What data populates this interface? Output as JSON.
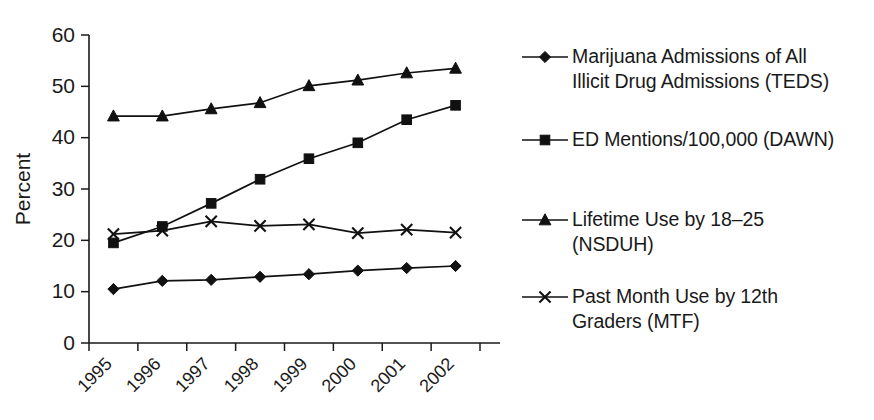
{
  "chart_data": {
    "type": "line",
    "title": "",
    "xlabel": "",
    "ylabel": "Percent",
    "categories": [
      "1995",
      "1996",
      "1997",
      "1998",
      "1999",
      "2000",
      "2001",
      "2002"
    ],
    "ylim": [
      0,
      60
    ],
    "yticks": [
      0,
      10,
      20,
      30,
      40,
      50,
      60
    ],
    "grid": false,
    "legend_position": "right",
    "series": [
      {
        "name": "Marijuana Admissions of All Illicit Drug Admissions (TEDS)",
        "marker": "diamond",
        "values": [
          10.5,
          12.1,
          12.3,
          12.9,
          13.4,
          14.1,
          14.6,
          15.0
        ]
      },
      {
        "name": "ED Mentions/100,000 (DAWN)",
        "marker": "square",
        "values": [
          19.5,
          22.7,
          27.2,
          31.9,
          35.9,
          39.0,
          43.5,
          46.3
        ]
      },
      {
        "name": "Lifetime Use by 18–25 (NSDUH)",
        "marker": "triangle",
        "values": [
          44.2,
          44.2,
          45.6,
          46.8,
          50.1,
          51.2,
          52.6,
          53.5
        ]
      },
      {
        "name": "Past Month Use by 12th Graders (MTF)",
        "marker": "x",
        "values": [
          21.2,
          21.9,
          23.7,
          22.8,
          23.1,
          21.4,
          22.1,
          21.5
        ]
      }
    ]
  },
  "axes": {
    "y_label": "Percent",
    "y_tick_labels": [
      "0",
      "10",
      "20",
      "30",
      "40",
      "50",
      "60"
    ],
    "x_tick_labels": [
      "1995",
      "1996",
      "1997",
      "1998",
      "1999",
      "2000",
      "2001",
      "2002"
    ]
  },
  "legend": {
    "entries": [
      {
        "marker": "diamond",
        "label": "Marijuana Admissions of All\nIllicit Drug Admissions (TEDS)"
      },
      {
        "marker": "square",
        "label": "ED Mentions/100,000 (DAWN)"
      },
      {
        "marker": "triangle",
        "label": "Lifetime Use by 18–25\n(NSDUH)"
      },
      {
        "marker": "x",
        "label": "Past Month Use by 12th\nGraders (MTF)"
      }
    ]
  },
  "colors": {
    "line": "#111111",
    "axis": "#1a1a1a",
    "background": "#ffffff"
  }
}
